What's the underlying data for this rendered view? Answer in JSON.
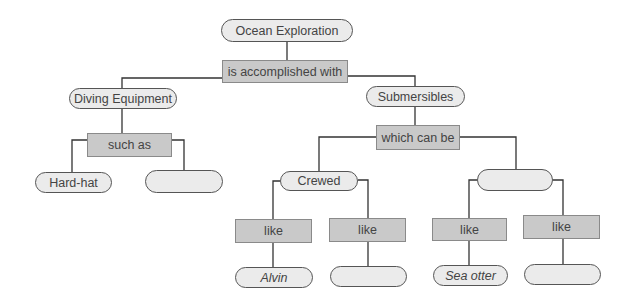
{
  "concept_map": {
    "root": "Ocean Exploration",
    "root_link": "is accomplished with",
    "diving": {
      "label": "Diving Equipment",
      "link": "such as",
      "examples": [
        "Hard-hat",
        ""
      ]
    },
    "submersibles": {
      "label": "Submersibles",
      "link": "which can be",
      "types": [
        {
          "label": "Crewed",
          "links": [
            "like",
            "like"
          ],
          "examples": [
            "Alvin",
            ""
          ]
        },
        {
          "label": "",
          "links": [
            "like",
            "like"
          ],
          "examples": [
            "Sea otter",
            ""
          ]
        }
      ]
    }
  },
  "colors": {
    "pill_fill": "#ebebeb",
    "box_fill": "#c9c9c9",
    "line": "#333333"
  }
}
